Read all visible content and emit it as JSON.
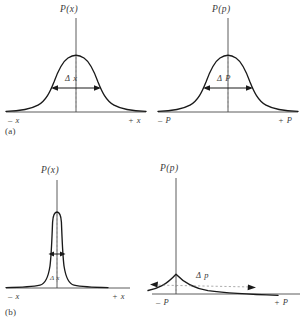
{
  "figure": {
    "background_color": "#ffffff",
    "curve_color": "#1a1a1a",
    "axis_color": "#4a4a4a",
    "guide_color": "#8a8a8a"
  },
  "rows": [
    {
      "part_label": "(a)",
      "panels": [
        {
          "id": "a-position",
          "y_axis_label": "P(x)",
          "x_axis_label_left": "– x",
          "x_axis_label_right": "+ x",
          "spread_label": "Δ x",
          "spread_kind": "wide",
          "curve_shape": "gaussian-broad"
        },
        {
          "id": "a-momentum",
          "y_axis_label": "P(p)",
          "x_axis_label_left": "– P",
          "x_axis_label_right": "+ P",
          "spread_label": "Δ P",
          "spread_kind": "wide",
          "curve_shape": "gaussian-broad"
        }
      ]
    },
    {
      "part_label": "(b)",
      "panels": [
        {
          "id": "b-position",
          "y_axis_label": "P(x)",
          "x_axis_label_left": "– x",
          "x_axis_label_right": "+ x",
          "spread_label": "Δ x",
          "spread_kind": "narrow",
          "curve_shape": "gaussian-narrow-tall"
        },
        {
          "id": "b-momentum",
          "y_axis_label": "P(p)",
          "x_axis_label_left": "– P",
          "x_axis_label_right": "+ P",
          "spread_label": "Δ p",
          "spread_kind": "very-wide",
          "curve_shape": "gaussian-flat-broad"
        }
      ]
    }
  ]
}
